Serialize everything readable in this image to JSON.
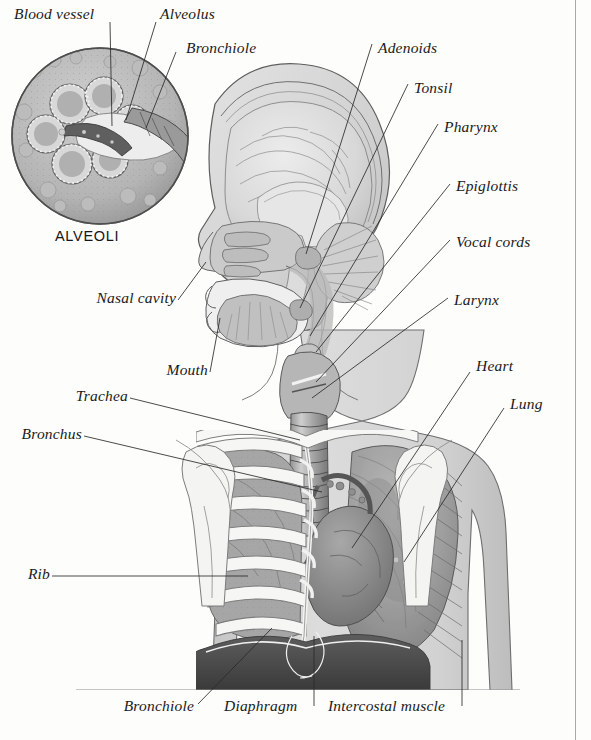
{
  "figure": {
    "inset_caption": "ALVEOLI",
    "body_fill": "#d6d6d6",
    "line_color": "#2a2a2a",
    "background": "#fdfdfc"
  },
  "labels": {
    "blood_vessel": "Blood vessel",
    "alveolus": "Alveolus",
    "bronchiole_top": "Bronchiole",
    "adenoids": "Adenoids",
    "tonsil": "Tonsil",
    "pharynx": "Pharynx",
    "epiglottis": "Epiglottis",
    "vocal_cords": "Vocal cords",
    "larynx": "Larynx",
    "heart": "Heart",
    "lung": "Lung",
    "nasal_cavity": "Nasal cavity",
    "mouth": "Mouth",
    "trachea": "Trachea",
    "bronchus": "Bronchus",
    "rib": "Rib",
    "bronchiole_bottom": "Bronchiole",
    "diaphragm": "Diaphragm",
    "intercostal_muscle": "Intercostal muscle"
  }
}
